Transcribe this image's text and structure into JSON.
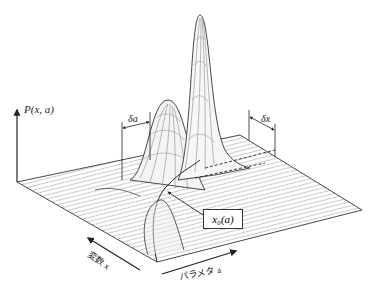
{
  "figure": {
    "type": "3d-surface-wireframe",
    "axis_vertical_label": "P(x, a)",
    "axis_x_label": "変数 x",
    "axis_a_label": "パラメタ a",
    "delta_a_label": "δa",
    "delta_x_label": "δx",
    "curve_label": "x₀(a)",
    "colors": {
      "line": "#333333",
      "mesh": "#555555",
      "background": "#ffffff"
    }
  }
}
